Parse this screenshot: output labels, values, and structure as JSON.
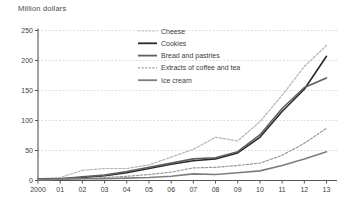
{
  "chart_data": {
    "type": "line",
    "title": "Million dollars",
    "xlabel": "",
    "ylabel": "Million dollars",
    "categories": [
      "2000",
      "01",
      "02",
      "03",
      "04",
      "05",
      "06",
      "07",
      "08",
      "09",
      "10",
      "11",
      "12",
      "13"
    ],
    "ylim": [
      0,
      250
    ],
    "yticks": [
      0,
      50,
      100,
      150,
      200,
      250
    ],
    "grid": "horizontal dotted",
    "legend_position": "inside top-center",
    "axis_color": "#555555",
    "grid_color": "#c9c9c9",
    "label_color": "#3d3d3d",
    "series": [
      {
        "name": "Cheese",
        "color": "#b4b4b4",
        "style": "dotted",
        "values": [
          3,
          5,
          17,
          20,
          20,
          26,
          39,
          52,
          72,
          66,
          98,
          142,
          190,
          225
        ]
      },
      {
        "name": "Cookies",
        "color": "#2a2a2a",
        "style": "solid",
        "values": [
          2,
          3,
          5,
          8,
          13,
          20,
          27,
          33,
          36,
          46,
          72,
          115,
          152,
          207
        ]
      },
      {
        "name": "Bread and pastries",
        "color": "#5f5f5f",
        "style": "solid",
        "values": [
          2,
          3,
          6,
          9,
          15,
          22,
          29,
          36,
          38,
          48,
          76,
          120,
          155,
          171
        ]
      },
      {
        "name": "Extracts of coffee and tea",
        "color": "#9a9a9a",
        "style": "dotted",
        "values": [
          1,
          2,
          3,
          5,
          7,
          10,
          14,
          21,
          22,
          25,
          29,
          42,
          62,
          87
        ]
      },
      {
        "name": "Ice cream",
        "color": "#7d7d7d",
        "style": "solid",
        "values": [
          1,
          2,
          3,
          3,
          4,
          5,
          7,
          11,
          10,
          13,
          16,
          25,
          36,
          48
        ]
      }
    ]
  }
}
